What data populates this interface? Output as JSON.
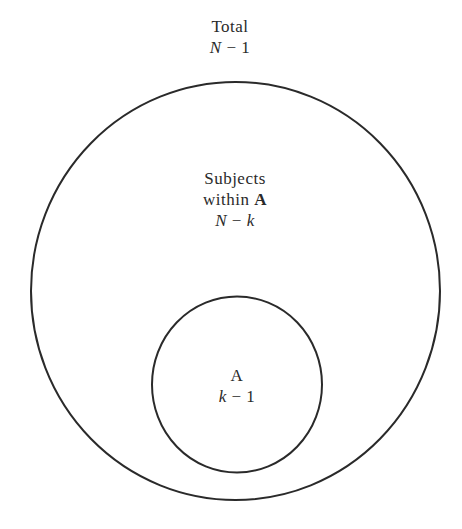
{
  "outer": {
    "title": "Total",
    "expr_var": "N",
    "expr_op": " − ",
    "expr_num": "1"
  },
  "middle": {
    "line1": "Subjects",
    "line2_text": "within ",
    "line2_bold": "A",
    "expr_var": "N",
    "expr_op": " − ",
    "expr_var2": "k"
  },
  "inner": {
    "title": "A",
    "expr_var": "k",
    "expr_op": " − ",
    "expr_num": "1"
  },
  "colors": {
    "stroke": "#2a2a2a",
    "background": "#ffffff"
  }
}
